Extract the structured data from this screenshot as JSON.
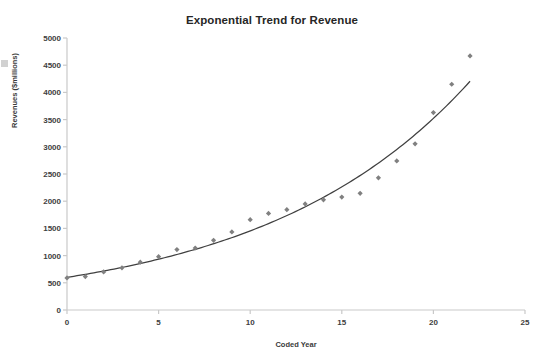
{
  "chart_data": {
    "type": "scatter",
    "title": "Exponential Trend for Revenue",
    "xlabel": "Coded Year",
    "ylabel": "Revenues ($millions)",
    "xlim": [
      0,
      25
    ],
    "ylim": [
      0,
      5000
    ],
    "xticks": [
      0,
      5,
      10,
      15,
      20,
      25
    ],
    "yticks": [
      0,
      500,
      1000,
      1500,
      2000,
      2500,
      3000,
      3500,
      4000,
      4500,
      5000
    ],
    "grid": false,
    "legend": "none",
    "marker_color": "#808080",
    "trendline_color": "#404040",
    "series": [
      {
        "name": "Revenue",
        "kind": "scatter",
        "marker": "diamond",
        "x": [
          0,
          1,
          2,
          3,
          4,
          5,
          6,
          7,
          8,
          9,
          10,
          11,
          12,
          13,
          14,
          15,
          16,
          17,
          18,
          19,
          20,
          21,
          22
        ],
        "values": [
          590,
          615,
          700,
          775,
          880,
          980,
          1110,
          1140,
          1280,
          1435,
          1660,
          1775,
          1845,
          1950,
          2025,
          2075,
          2145,
          2430,
          2740,
          3055,
          3630,
          4150,
          4670
        ]
      },
      {
        "name": "Exponential trend",
        "kind": "line",
        "equation_form": "y = a * e^(b*x)",
        "a": 600,
        "b": 0.0885,
        "x": [
          0,
          22
        ],
        "values": [
          600,
          4200
        ]
      }
    ]
  }
}
